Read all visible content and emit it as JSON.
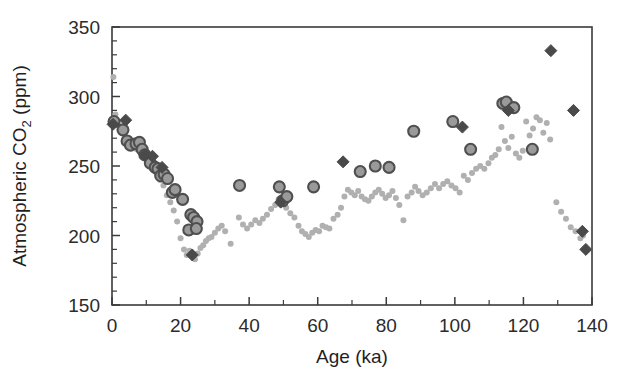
{
  "figure": {
    "background_color": "#ffffff",
    "frame_color": "#3a3a3a"
  },
  "chart_data": {
    "type": "scatter",
    "title": "",
    "xlabel": "Age (ka)",
    "ylabel_main": "Atmospheric CO",
    "ylabel_sub": "2",
    "ylabel_units": " (ppm)",
    "ylabel_full": "Atmospheric CO2 (ppm)",
    "xlim": [
      0,
      140
    ],
    "ylim": [
      150,
      350
    ],
    "xticks": [
      0,
      20,
      40,
      60,
      80,
      100,
      120,
      140
    ],
    "xtick_labels": [
      "0",
      "20",
      "40",
      "60",
      "80",
      "100",
      "120",
      "140"
    ],
    "x_minor_step": 10,
    "yticks": [
      150,
      200,
      250,
      300,
      350
    ],
    "ytick_labels": [
      "150",
      "200",
      "250",
      "300",
      "350"
    ],
    "y_minor_step": 10,
    "grid": false,
    "legend": "none",
    "series": [
      {
        "name": "ice-core-record",
        "marker": "small-dot",
        "color": "#b0b0b0",
        "edge_color": "#b0b0b0",
        "size": 6,
        "points": [
          [
            0.4,
            314
          ],
          [
            1.0,
            287
          ],
          [
            1.6,
            281
          ],
          [
            2.6,
            276
          ],
          [
            5.0,
            269
          ],
          [
            6.0,
            266
          ],
          [
            7.2,
            262
          ],
          [
            8.4,
            259
          ],
          [
            9.6,
            258
          ],
          [
            11.0,
            252
          ],
          [
            12.2,
            248
          ],
          [
            13.0,
            245
          ],
          [
            14.0,
            240
          ],
          [
            15.0,
            236
          ],
          [
            16.0,
            229
          ],
          [
            17.0,
            224
          ],
          [
            18.0,
            218
          ],
          [
            19.0,
            210
          ],
          [
            20.0,
            198
          ],
          [
            21.0,
            190
          ],
          [
            21.8,
            186
          ],
          [
            22.6,
            189
          ],
          [
            23.4,
            185
          ],
          [
            24.2,
            183
          ],
          [
            25.0,
            187
          ],
          [
            25.8,
            191
          ],
          [
            26.6,
            193
          ],
          [
            27.4,
            196
          ],
          [
            28.2,
            198
          ],
          [
            29.0,
            199
          ],
          [
            30.0,
            202
          ],
          [
            31.0,
            205
          ],
          [
            32.0,
            207
          ],
          [
            33.0,
            203
          ],
          [
            34.6,
            194
          ],
          [
            37.0,
            213
          ],
          [
            38.2,
            208
          ],
          [
            39.4,
            205
          ],
          [
            40.6,
            208
          ],
          [
            41.8,
            211
          ],
          [
            43.0,
            209
          ],
          [
            44.0,
            212
          ],
          [
            45.2,
            215
          ],
          [
            46.4,
            219
          ],
          [
            47.6,
            222
          ],
          [
            48.6,
            226
          ],
          [
            49.6,
            225
          ],
          [
            50.8,
            220
          ],
          [
            52.0,
            216
          ],
          [
            53.2,
            213
          ],
          [
            54.4,
            207
          ],
          [
            55.4,
            203
          ],
          [
            56.4,
            201
          ],
          [
            57.4,
            199
          ],
          [
            58.4,
            202
          ],
          [
            59.4,
            204
          ],
          [
            60.4,
            203
          ],
          [
            61.4,
            207
          ],
          [
            62.4,
            206
          ],
          [
            63.4,
            205
          ],
          [
            64.6,
            212
          ],
          [
            65.8,
            215
          ],
          [
            66.8,
            220
          ],
          [
            67.8,
            228
          ],
          [
            68.8,
            233
          ],
          [
            69.8,
            231
          ],
          [
            70.8,
            229
          ],
          [
            71.8,
            232
          ],
          [
            72.8,
            228
          ],
          [
            73.8,
            226
          ],
          [
            74.8,
            225
          ],
          [
            75.8,
            228
          ],
          [
            76.8,
            231
          ],
          [
            77.8,
            233
          ],
          [
            78.8,
            230
          ],
          [
            79.8,
            227
          ],
          [
            80.8,
            229
          ],
          [
            81.8,
            232
          ],
          [
            82.8,
            227
          ],
          [
            83.8,
            222
          ],
          [
            85.0,
            211
          ],
          [
            86.2,
            228
          ],
          [
            87.4,
            231
          ],
          [
            88.4,
            235
          ],
          [
            89.4,
            232
          ],
          [
            90.6,
            229
          ],
          [
            91.8,
            231
          ],
          [
            93.0,
            234
          ],
          [
            94.2,
            237
          ],
          [
            95.4,
            234
          ],
          [
            96.6,
            237
          ],
          [
            97.8,
            239
          ],
          [
            99.0,
            236
          ],
          [
            100.2,
            234
          ],
          [
            101.4,
            231
          ],
          [
            102.6,
            243
          ],
          [
            103.8,
            240
          ],
          [
            105.0,
            245
          ],
          [
            106.2,
            248
          ],
          [
            107.4,
            250
          ],
          [
            108.6,
            248
          ],
          [
            109.8,
            252
          ],
          [
            110.8,
            256
          ],
          [
            111.8,
            258
          ],
          [
            112.8,
            262
          ],
          [
            113.6,
            278
          ],
          [
            114.6,
            268
          ],
          [
            115.6,
            263
          ],
          [
            116.6,
            271
          ],
          [
            117.8,
            259
          ],
          [
            118.8,
            256
          ],
          [
            119.8,
            261
          ],
          [
            120.8,
            282
          ],
          [
            121.8,
            272
          ],
          [
            122.8,
            277
          ],
          [
            123.8,
            285
          ],
          [
            124.8,
            283
          ],
          [
            125.8,
            274
          ],
          [
            126.8,
            281
          ],
          [
            127.8,
            269
          ],
          [
            129.6,
            224
          ],
          [
            131.0,
            217
          ],
          [
            132.4,
            212
          ],
          [
            133.8,
            206
          ],
          [
            135.2,
            203
          ],
          [
            136.6,
            198
          ],
          [
            137.4,
            200
          ]
        ]
      },
      {
        "name": "proxy-circles",
        "marker": "circle",
        "color": "#9a9a9a",
        "edge_color": "#4f4f4f",
        "size": 11,
        "points": [
          [
            0.6,
            282
          ],
          [
            3.2,
            276
          ],
          [
            4.4,
            268
          ],
          [
            5.4,
            265
          ],
          [
            7.0,
            266
          ],
          [
            8.0,
            267
          ],
          [
            8.8,
            262
          ],
          [
            9.6,
            258
          ],
          [
            11.2,
            252
          ],
          [
            12.6,
            249
          ],
          [
            13.4,
            248
          ],
          [
            14.2,
            243
          ],
          [
            15.2,
            244
          ],
          [
            16.2,
            241
          ],
          [
            17.6,
            231
          ],
          [
            18.4,
            233
          ],
          [
            20.6,
            226
          ],
          [
            23.0,
            215
          ],
          [
            23.8,
            213
          ],
          [
            24.8,
            210
          ],
          [
            22.4,
            204
          ],
          [
            24.6,
            205
          ],
          [
            37.2,
            236
          ],
          [
            48.8,
            235
          ],
          [
            49.8,
            225
          ],
          [
            51.0,
            228
          ],
          [
            58.8,
            235
          ],
          [
            72.4,
            246
          ],
          [
            76.8,
            250
          ],
          [
            80.8,
            249
          ],
          [
            88.0,
            275
          ],
          [
            99.4,
            282
          ],
          [
            104.6,
            262
          ],
          [
            114.0,
            295
          ],
          [
            115.0,
            296
          ],
          [
            117.2,
            292
          ],
          [
            122.6,
            262
          ]
        ]
      },
      {
        "name": "marine-diamonds",
        "marker": "diamond",
        "color": "#4a4a4a",
        "edge_color": "#4a4a4a",
        "size": 12,
        "points": [
          [
            0.3,
            280
          ],
          [
            4.0,
            283
          ],
          [
            9.6,
            258
          ],
          [
            11.8,
            257
          ],
          [
            14.6,
            249
          ],
          [
            23.4,
            186
          ],
          [
            49.2,
            224
          ],
          [
            67.4,
            253
          ],
          [
            102.2,
            278
          ],
          [
            115.6,
            290
          ],
          [
            128.0,
            333
          ],
          [
            134.6,
            290
          ],
          [
            137.2,
            203
          ],
          [
            138.2,
            190
          ]
        ]
      }
    ]
  }
}
